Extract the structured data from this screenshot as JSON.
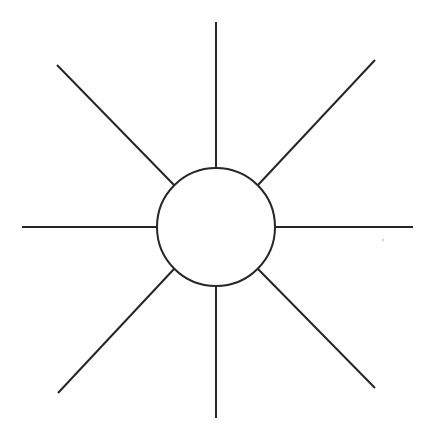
{
  "figure": {
    "background_color": "#fefefe",
    "stroke_color": "#262626",
    "stroke_width": 2,
    "canvas": {
      "width": 434,
      "height": 441
    }
  },
  "hub": {
    "name": "central circle",
    "center_x": 216,
    "center_y": 227,
    "radius": 59
  },
  "rays": [
    {
      "label": "north ray",
      "angle_deg": 90,
      "inner_x": 216,
      "inner_y": 168,
      "outer_x": 216,
      "outer_y": 22
    },
    {
      "label": "northeast ray",
      "angle_deg": 45,
      "inner_x": 258,
      "inner_y": 185,
      "outer_x": 375,
      "outer_y": 60
    },
    {
      "label": "east ray",
      "angle_deg": 0,
      "inner_x": 275,
      "inner_y": 227,
      "outer_x": 413,
      "outer_y": 227
    },
    {
      "label": "southeast ray",
      "angle_deg": -45,
      "inner_x": 258,
      "inner_y": 269,
      "outer_x": 375,
      "outer_y": 388
    },
    {
      "label": "south ray",
      "angle_deg": -90,
      "inner_x": 216,
      "inner_y": 286,
      "outer_x": 216,
      "outer_y": 418
    },
    {
      "label": "southwest ray",
      "angle_deg": -135,
      "inner_x": 174,
      "inner_y": 269,
      "outer_x": 58,
      "outer_y": 393
    },
    {
      "label": "west ray",
      "angle_deg": 180,
      "inner_x": 157,
      "inner_y": 227,
      "outer_x": 22,
      "outer_y": 227
    },
    {
      "label": "northwest ray",
      "angle_deg": 135,
      "inner_x": 174,
      "inner_y": 185,
      "outer_x": 57,
      "outer_y": 65
    }
  ],
  "artifacts": [
    {
      "label": "paper speck",
      "x": 383,
      "y": 240,
      "r": 1.4
    }
  ],
  "chart_data": {
    "type": "diagram",
    "ray_count": 8,
    "angle_step_deg": 45,
    "categories": [
      "north ray",
      "northeast ray",
      "east ray",
      "southeast ray",
      "south ray",
      "southwest ray",
      "west ray",
      "northwest ray"
    ],
    "values": [
      146,
      168,
      138,
      168,
      132,
      168,
      135,
      168
    ],
    "ylabel": "ray length (px)",
    "xlabel": "direction"
  }
}
